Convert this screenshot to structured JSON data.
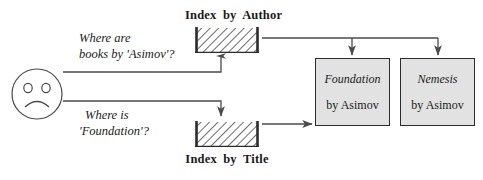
{
  "diagram": {
    "colors": {
      "stroke": "#2b2b2b",
      "line": "#4a4a4a",
      "book_fill": "#e2e2e2",
      "hatch": "#3a3a3a",
      "background": "#ffffff"
    },
    "user": {
      "icon": "sad-face-icon",
      "expression": "frowning"
    },
    "queries": [
      {
        "id": "query-author",
        "line1": "Where are",
        "line2": "books by 'Asimov'?",
        "target": "Index by Author"
      },
      {
        "id": "query-title",
        "line1": "Where is",
        "line2": "'Foundation'?",
        "target": "Index by Title"
      }
    ],
    "indexes": [
      {
        "id": "index-by-author",
        "label": "Index by Author",
        "label_position": "above"
      },
      {
        "id": "index-by-title",
        "label": "Index by Title",
        "label_position": "below"
      }
    ],
    "books": [
      {
        "id": "book-foundation",
        "title": "Foundation",
        "author": "by Asimov"
      },
      {
        "id": "book-nemesis",
        "title": "Nemesis",
        "author": "by Asimov"
      }
    ]
  }
}
